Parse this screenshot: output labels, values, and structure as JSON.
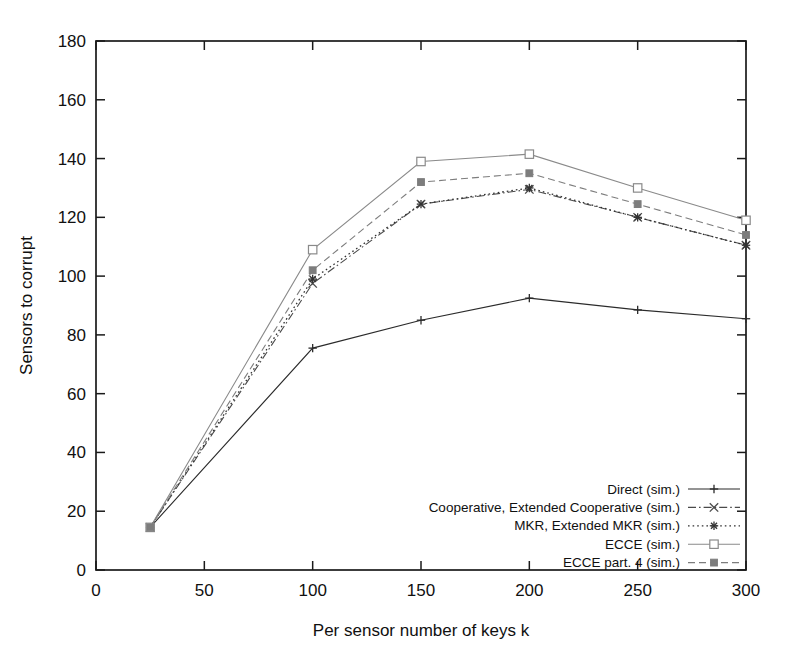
{
  "chart_data": {
    "type": "line",
    "title": "",
    "xlabel": "Per sensor number of keys k",
    "ylabel": "Sensors to corrupt",
    "xlim": [
      0,
      300
    ],
    "ylim": [
      0,
      180
    ],
    "xticks": [
      0,
      50,
      100,
      150,
      200,
      250,
      300
    ],
    "yticks": [
      0,
      20,
      40,
      60,
      80,
      100,
      120,
      140,
      160,
      180
    ],
    "xticklabels": [
      "0",
      "50",
      "100",
      "150",
      "200",
      "250",
      "300"
    ],
    "yticklabels": [
      "0",
      "20",
      "40",
      "60",
      "80",
      "100",
      "120",
      "140",
      "160",
      "180"
    ],
    "grid": false,
    "legend_position": "bottom-right",
    "x": [
      25,
      100,
      150,
      200,
      250,
      300
    ],
    "series": [
      {
        "name": "Direct (sim.)",
        "marker": "plus",
        "dash": "solid",
        "color": "#2b2b2b",
        "values": [
          14.5,
          75.5,
          85.0,
          92.5,
          88.5,
          85.5
        ]
      },
      {
        "name": "Cooperative, Extended Cooperative (sim.)",
        "marker": "cross",
        "dash": "dashdot",
        "color": "#4a4a4a",
        "values": [
          14.5,
          97.5,
          124.5,
          129.5,
          120.0,
          110.5
        ]
      },
      {
        "name": "MKR, Extended MKR (sim.)",
        "marker": "asterisk",
        "dash": "dotted",
        "color": "#333333",
        "values": [
          14.5,
          99.0,
          124.5,
          130.0,
          120.0,
          110.5
        ]
      },
      {
        "name": "ECCE (sim.)",
        "marker": "open-square",
        "dash": "solid-light",
        "color": "#8a8a8a",
        "values": [
          14.5,
          109.0,
          139.0,
          141.5,
          130.0,
          119.0
        ]
      },
      {
        "name": "ECCE part. 4 (sim.)",
        "marker": "filled-square",
        "dash": "dashed",
        "color": "#7d7d7d",
        "values": [
          14.5,
          102.0,
          132.0,
          135.0,
          124.5,
          114.0
        ]
      }
    ]
  }
}
